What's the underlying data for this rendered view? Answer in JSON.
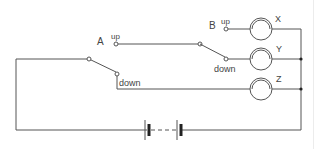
{
  "diagram": {
    "type": "circuit",
    "switches": [
      {
        "id": "A",
        "label": "A",
        "positions": {
          "up": "up",
          "down": "down"
        }
      },
      {
        "id": "B",
        "label": "B",
        "positions": {
          "up": "up",
          "down": "down"
        }
      }
    ],
    "lamps": [
      {
        "id": "X",
        "label": "X"
      },
      {
        "id": "Y",
        "label": "Y"
      },
      {
        "id": "Z",
        "label": "Z"
      }
    ],
    "battery": {
      "label": "",
      "cells": 2,
      "dashed_connection": true
    },
    "colors": {
      "wire": "#555555",
      "background": "#ffffff",
      "text": "#444444"
    }
  }
}
